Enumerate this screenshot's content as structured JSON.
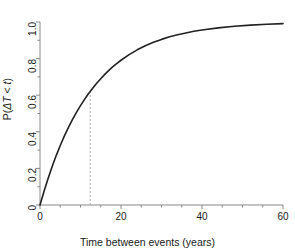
{
  "chart_data": {
    "type": "line",
    "title": "",
    "subtitle": "",
    "xlabel": "Time between events (years)",
    "ylabel": "P(ΔT < t)",
    "ylabel_parts": {
      "p": "P(",
      "delta_t": "ΔT",
      "lt": " < ",
      "t": "t",
      "close": ")"
    },
    "xlim": [
      0,
      60
    ],
    "ylim": [
      0,
      1.0
    ],
    "xticks": [
      0,
      20,
      40,
      60
    ],
    "xtick_labels": [
      "0",
      "20",
      "40",
      "60"
    ],
    "x_minor_ticks": [
      5,
      10,
      15,
      25,
      30,
      35,
      45,
      50,
      55
    ],
    "yticks": [
      0,
      0.2,
      0.4,
      0.6,
      0.8,
      1.0
    ],
    "ytick_labels": [
      "0",
      "0.2",
      "0.4",
      "0.6",
      "0.8",
      "1.0"
    ],
    "y_minor_ticks": [
      0.1,
      0.3,
      0.5,
      0.7,
      0.9
    ],
    "grid": false,
    "legend": null,
    "line_color": "#222222",
    "line_width": 1.6,
    "axis_color": "#888888",
    "annotation": {
      "type": "vertical-dashed-line",
      "x": 12.4,
      "y": 0.62,
      "color": "#aaaaaa",
      "label": ""
    },
    "model": {
      "name": "exponential-cdf",
      "formula": "P(dT < t) = 1 - exp(-t / lambda)",
      "lambda": 12.8
    },
    "x": [
      0,
      1,
      2,
      3,
      4,
      5,
      6,
      7,
      8,
      9,
      10,
      11,
      12,
      12.4,
      13,
      14,
      15,
      16,
      17,
      18,
      19,
      20,
      22,
      24,
      26,
      28,
      30,
      32,
      34,
      36,
      38,
      40,
      44,
      48,
      52,
      56,
      60
    ],
    "values": [
      0.0,
      0.075,
      0.145,
      0.21,
      0.27,
      0.325,
      0.376,
      0.423,
      0.466,
      0.506,
      0.543,
      0.577,
      0.609,
      0.62,
      0.638,
      0.665,
      0.69,
      0.714,
      0.736,
      0.756,
      0.774,
      0.791,
      0.822,
      0.848,
      0.87,
      0.889,
      0.905,
      0.919,
      0.93,
      0.94,
      0.949,
      0.956,
      0.968,
      0.977,
      0.983,
      0.988,
      0.991
    ],
    "series": [
      {
        "name": "Cumulative probability",
        "values": [
          0.0,
          0.075,
          0.145,
          0.21,
          0.27,
          0.325,
          0.376,
          0.423,
          0.466,
          0.506,
          0.543,
          0.577,
          0.609,
          0.62,
          0.638,
          0.665,
          0.69,
          0.714,
          0.736,
          0.756,
          0.774,
          0.791,
          0.822,
          0.848,
          0.87,
          0.889,
          0.905,
          0.919,
          0.93,
          0.94,
          0.949,
          0.956,
          0.968,
          0.977,
          0.983,
          0.988,
          0.991
        ]
      }
    ]
  }
}
